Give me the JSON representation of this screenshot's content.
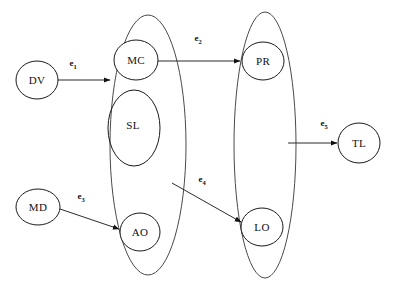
{
  "diagram": {
    "title": "",
    "background_color": "#ffffff",
    "stroke_color": "#2b2b2b",
    "group_stroke_color": "#4a4a4a",
    "nodes": [
      {
        "id": "DV",
        "label": "DV",
        "cx": 37,
        "cy": 80,
        "rx": 21,
        "ry": 19
      },
      {
        "id": "MD",
        "label": "MD",
        "cx": 38,
        "cy": 207,
        "rx": 22,
        "ry": 18
      },
      {
        "id": "MC",
        "label": "MC",
        "cx": 136,
        "cy": 60,
        "rx": 22,
        "ry": 20
      },
      {
        "id": "SL",
        "label": "SL",
        "cx": 134,
        "cy": 128,
        "rx": 26,
        "ry": 38
      },
      {
        "id": "AO",
        "label": "AO",
        "cx": 140,
        "cy": 232,
        "rx": 20,
        "ry": 19
      },
      {
        "id": "PR",
        "label": "PR",
        "cx": 263,
        "cy": 61,
        "rx": 21,
        "ry": 19
      },
      {
        "id": "LO",
        "label": "LO",
        "cx": 262,
        "cy": 227,
        "rx": 21,
        "ry": 19
      },
      {
        "id": "TL",
        "label": "TL",
        "cx": 359,
        "cy": 143,
        "rx": 21,
        "ry": 20
      }
    ],
    "groups": [
      {
        "id": "left-group",
        "cx": 148,
        "cy": 145,
        "rx": 38,
        "ry": 130
      },
      {
        "id": "right-group",
        "cx": 265,
        "cy": 145,
        "rx": 31,
        "ry": 133
      }
    ],
    "edges": [
      {
        "id": "e1",
        "label": "e",
        "subscript": "1",
        "from": "DV",
        "to": "left-group",
        "label_x": 73,
        "label_y": 66
      },
      {
        "id": "e2",
        "label": "e",
        "subscript": "2",
        "from": "MC",
        "to": "PR",
        "label_x": 198,
        "label_y": 41
      },
      {
        "id": "e3",
        "label": "e",
        "subscript": "3",
        "from": "MD",
        "to": "AO",
        "label_x": 81,
        "label_y": 199
      },
      {
        "id": "e4",
        "label": "e",
        "subscript": "4",
        "from": "SL",
        "to": "LO",
        "label_x": 202,
        "label_y": 182
      },
      {
        "id": "e5",
        "label": "e",
        "subscript": "5",
        "from": "right-group",
        "to": "TL",
        "label_x": 324,
        "label_y": 126
      }
    ]
  }
}
